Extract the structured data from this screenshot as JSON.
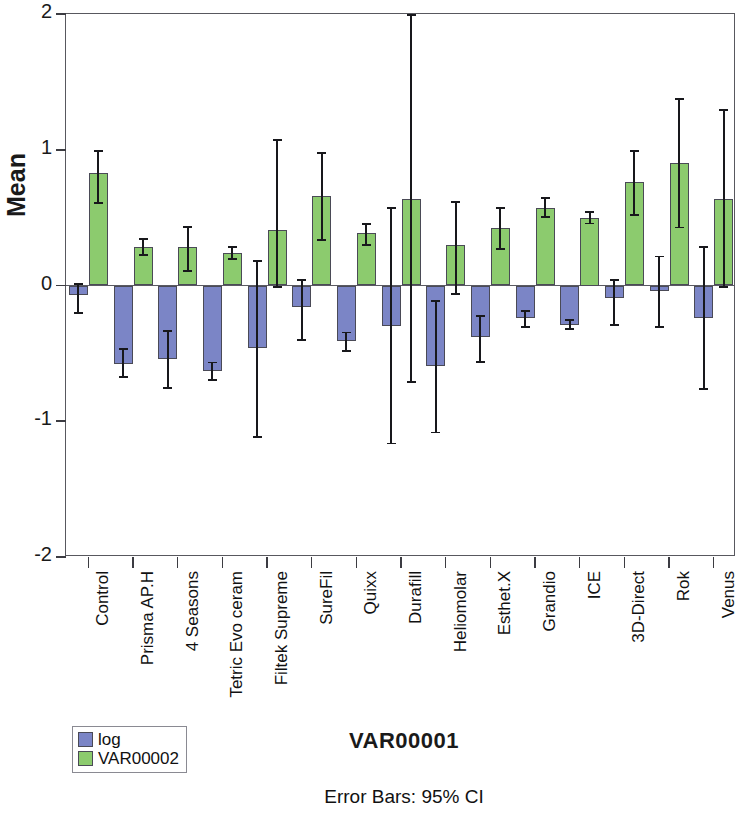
{
  "chart_data": {
    "type": "bar",
    "title": "",
    "xlabel": "VAR00001",
    "ylabel": "Mean",
    "footnote": "Error Bars: 95% CI",
    "ylim": [
      -2,
      2
    ],
    "yticks": [
      2,
      1,
      0,
      -1,
      -2
    ],
    "ytick_labels": [
      "2",
      "1",
      "0",
      "-1",
      "-2"
    ],
    "grid": false,
    "legend_position": "bottom-left",
    "orientation": "vertical",
    "error_bar_type": "95% CI",
    "categories": [
      "Control",
      "Prisma AP.H",
      "4 Seasons",
      "Tetric Evo ceram",
      "Filtek Supreme",
      "SureFil",
      "Quixx",
      "Durafill",
      "Heliomolar",
      "Esthet.X",
      "Grandio",
      "ICE",
      "3D-Direct",
      "Rok",
      "Venus"
    ],
    "series": [
      {
        "name": "log",
        "color": "#7b85c6",
        "values": [
          -0.07,
          -0.58,
          -0.54,
          -0.63,
          -0.46,
          -0.16,
          -0.41,
          -0.3,
          -0.59,
          -0.38,
          -0.24,
          -0.29,
          -0.09,
          -0.04,
          -0.24
        ],
        "ci_lower": [
          -0.21,
          -0.68,
          -0.76,
          -0.7,
          -1.12,
          -0.41,
          -0.49,
          -1.17,
          -1.09,
          -0.57,
          -0.31,
          -0.33,
          -0.3,
          -0.31,
          -0.77
        ],
        "ci_upper": [
          0.02,
          -0.46,
          -0.33,
          -0.56,
          0.19,
          0.05,
          -0.34,
          0.58,
          -0.11,
          -0.22,
          -0.18,
          -0.25,
          0.05,
          0.22,
          0.29
        ]
      },
      {
        "name": "VAR00002",
        "color": "#8ccb6e",
        "values": [
          0.83,
          0.28,
          0.28,
          0.24,
          0.41,
          0.66,
          0.39,
          0.64,
          0.3,
          0.42,
          0.57,
          0.5,
          0.76,
          0.9,
          0.64
        ],
        "ci_lower": [
          0.6,
          0.22,
          0.1,
          0.19,
          -0.02,
          0.33,
          0.29,
          -0.72,
          -0.07,
          0.26,
          0.5,
          0.45,
          0.51,
          0.42,
          -0.02
        ],
        "ci_upper": [
          1.0,
          0.35,
          0.44,
          0.29,
          1.08,
          0.98,
          0.46,
          2.0,
          0.62,
          0.58,
          0.65,
          0.55,
          1.0,
          1.38,
          1.3
        ]
      }
    ]
  },
  "legend": {
    "items": [
      {
        "label": "log",
        "color": "#7b85c6"
      },
      {
        "label": "VAR00002",
        "color": "#8ccb6e"
      }
    ]
  }
}
